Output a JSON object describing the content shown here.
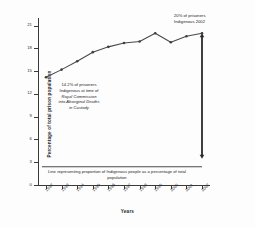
{
  "chart_data": {
    "type": "line",
    "title": "",
    "xlabel": "Years",
    "ylabel": "Percentage of total prison population",
    "categories": [
      "1992",
      "1993",
      "1994",
      "1995",
      "1996",
      "1997",
      "1998",
      "1999",
      "2000",
      "2001",
      "2002"
    ],
    "values": [
      14.2,
      15.2,
      16.3,
      17.5,
      18.2,
      18.7,
      18.9,
      20.0,
      18.8,
      19.6,
      20.0
    ],
    "series": [
      {
        "name": "Indigenous prisoners as percentage of total prison population",
        "values": [
          14.2,
          15.2,
          16.3,
          17.5,
          18.2,
          18.7,
          18.9,
          20.0,
          18.8,
          19.6,
          20.0
        ]
      }
    ],
    "reference_line": {
      "label": "Line representing proportion of Indigenous people as a percentage of total population",
      "value": 2.4
    },
    "ylim": [
      0,
      22
    ],
    "xlim_categories": 11,
    "yticks": [
      0,
      3,
      6,
      9,
      12,
      15,
      18,
      21
    ],
    "ytick_labels": [
      "0",
      "3",
      "6",
      "9",
      "12",
      "15",
      "18",
      "21"
    ],
    "grid": false,
    "legend": "none",
    "annotations": [
      {
        "name": "start-value-note",
        "lines": [
          "14.2% of prisoners",
          "Indigenous at time of",
          "Royal Commission",
          "into Aboriginal Deaths",
          "in Custody"
        ],
        "italic_from_line": 2
      },
      {
        "name": "end-value-note",
        "lines": [
          "20% of prisoners",
          "Indigenous 2002"
        ]
      }
    ],
    "arrow": {
      "name": "gap-arrow",
      "from_value": 20.0,
      "to_value": 2.4,
      "at_category": "2002",
      "double_headed": true
    }
  },
  "colors": {
    "line": "#4a4a4a",
    "axis": "#3a3a3a",
    "text": "#1a1a1a",
    "reference": "#4a4a4a",
    "arrow": "#2a2a2a"
  },
  "axis": {
    "y_title": "Percentage of total prison population",
    "x_title": "Years"
  }
}
